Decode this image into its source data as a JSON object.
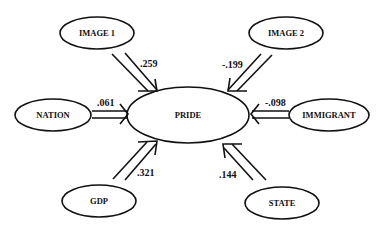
{
  "diagram": {
    "type": "path-diagram",
    "center_node": {
      "id": "pride",
      "label": "PRIDE"
    },
    "nodes": [
      {
        "id": "image1",
        "label": "IMAGE 1"
      },
      {
        "id": "image2",
        "label": "IMAGE 2"
      },
      {
        "id": "nation",
        "label": "NATION"
      },
      {
        "id": "immigrant",
        "label": "IMMIGRANT"
      },
      {
        "id": "gdp",
        "label": "GDP"
      },
      {
        "id": "state",
        "label": "STATE"
      }
    ],
    "edges": [
      {
        "from": "image1",
        "to": "pride",
        "coefficient": ".259"
      },
      {
        "from": "image2",
        "to": "pride",
        "coefficient": "-.199"
      },
      {
        "from": "nation",
        "to": "pride",
        "coefficient": ".061"
      },
      {
        "from": "immigrant",
        "to": "pride",
        "coefficient": "-.098"
      },
      {
        "from": "gdp",
        "to": "pride",
        "coefficient": ".321"
      },
      {
        "from": "state",
        "to": "pride",
        "coefficient": ".144"
      }
    ]
  }
}
